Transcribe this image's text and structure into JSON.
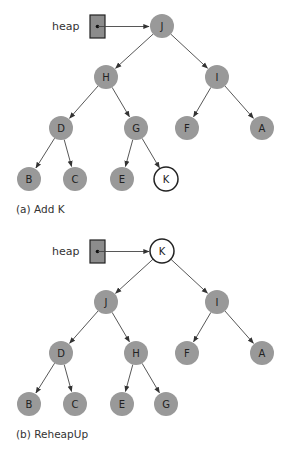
{
  "colors": {
    "node_fill": "#999999",
    "highlight_fill": "#ffffff",
    "stroke": "#222222",
    "edge": "#444444",
    "heap_box_fill": "#8c8c8c"
  },
  "diagrams": [
    {
      "id": "a",
      "caption": "(a) Add K",
      "heap_label": "heap",
      "offset_y": 0,
      "nodes": [
        {
          "id": "n0",
          "label": "J",
          "x": 162,
          "y": 26,
          "highlight": false
        },
        {
          "id": "n1",
          "label": "H",
          "x": 106,
          "y": 77,
          "highlight": false
        },
        {
          "id": "n2",
          "label": "I",
          "x": 217,
          "y": 77,
          "highlight": false
        },
        {
          "id": "n3",
          "label": "D",
          "x": 61,
          "y": 128,
          "highlight": false
        },
        {
          "id": "n4",
          "label": "G",
          "x": 136,
          "y": 128,
          "highlight": false
        },
        {
          "id": "n5",
          "label": "F",
          "x": 187,
          "y": 128,
          "highlight": false
        },
        {
          "id": "n6",
          "label": "A",
          "x": 262,
          "y": 128,
          "highlight": false
        },
        {
          "id": "n7",
          "label": "B",
          "x": 29,
          "y": 179,
          "highlight": false
        },
        {
          "id": "n8",
          "label": "C",
          "x": 75,
          "y": 179,
          "highlight": false
        },
        {
          "id": "n9",
          "label": "E",
          "x": 122,
          "y": 179,
          "highlight": false
        },
        {
          "id": "n10",
          "label": "K",
          "x": 166,
          "y": 179,
          "highlight": true
        }
      ],
      "edges": [
        [
          "n0",
          "n1"
        ],
        [
          "n0",
          "n2"
        ],
        [
          "n1",
          "n3"
        ],
        [
          "n1",
          "n4"
        ],
        [
          "n2",
          "n5"
        ],
        [
          "n2",
          "n6"
        ],
        [
          "n3",
          "n7"
        ],
        [
          "n3",
          "n8"
        ],
        [
          "n4",
          "n9"
        ],
        [
          "n4",
          "n10"
        ]
      ]
    },
    {
      "id": "b",
      "caption": "(b) ReheapUp",
      "heap_label": "heap",
      "offset_y": 225,
      "nodes": [
        {
          "id": "n0",
          "label": "K",
          "x": 162,
          "y": 26,
          "highlight": true
        },
        {
          "id": "n1",
          "label": "J",
          "x": 106,
          "y": 77,
          "highlight": false
        },
        {
          "id": "n2",
          "label": "I",
          "x": 217,
          "y": 77,
          "highlight": false
        },
        {
          "id": "n3",
          "label": "D",
          "x": 61,
          "y": 128,
          "highlight": false
        },
        {
          "id": "n4",
          "label": "H",
          "x": 136,
          "y": 128,
          "highlight": false
        },
        {
          "id": "n5",
          "label": "F",
          "x": 187,
          "y": 128,
          "highlight": false
        },
        {
          "id": "n6",
          "label": "A",
          "x": 262,
          "y": 128,
          "highlight": false
        },
        {
          "id": "n7",
          "label": "B",
          "x": 29,
          "y": 179,
          "highlight": false
        },
        {
          "id": "n8",
          "label": "C",
          "x": 75,
          "y": 179,
          "highlight": false
        },
        {
          "id": "n9",
          "label": "E",
          "x": 122,
          "y": 179,
          "highlight": false
        },
        {
          "id": "n10",
          "label": "G",
          "x": 166,
          "y": 179,
          "highlight": false
        }
      ],
      "edges": [
        [
          "n0",
          "n1"
        ],
        [
          "n0",
          "n2"
        ],
        [
          "n1",
          "n3"
        ],
        [
          "n1",
          "n4"
        ],
        [
          "n2",
          "n5"
        ],
        [
          "n2",
          "n6"
        ],
        [
          "n3",
          "n7"
        ],
        [
          "n3",
          "n8"
        ],
        [
          "n4",
          "n9"
        ],
        [
          "n4",
          "n10"
        ]
      ]
    }
  ]
}
